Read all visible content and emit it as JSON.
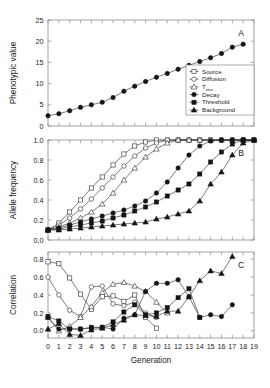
{
  "figure": {
    "xlabel": "Generation",
    "panels": [
      "A",
      "B",
      "C"
    ]
  },
  "legend": {
    "entries": [
      {
        "label": "Source",
        "marker": "open-square"
      },
      {
        "label": "Diffusion",
        "marker": "open-circle"
      },
      {
        "label": "T",
        "sub": "enz",
        "marker": "open-triangle"
      },
      {
        "label": "Decay",
        "marker": "filled-circle"
      },
      {
        "label": "Threshold",
        "marker": "filled-square"
      },
      {
        "label": "Background",
        "marker": "filled-triangle"
      }
    ]
  },
  "chart_data": [
    {
      "type": "line",
      "panel": "A",
      "title": "",
      "xlabel": "",
      "ylabel": "Phenotypic value",
      "xlim": [
        0,
        19
      ],
      "ylim": [
        0,
        25
      ],
      "xticks": [
        0,
        1,
        2,
        3,
        4,
        5,
        6,
        7,
        8,
        9,
        10,
        11,
        12,
        13,
        14,
        15,
        16,
        17,
        18,
        19
      ],
      "yticks": [
        0,
        5,
        10,
        15,
        20,
        25
      ],
      "ytick_labels": [
        "0",
        "5",
        "10",
        "15",
        "20",
        "25"
      ],
      "grid": false,
      "legend_position": "inside-lower-right",
      "series": [
        {
          "name": "Phenotypic value",
          "marker": "filled-circle",
          "x": [
            0,
            1,
            2,
            3,
            4,
            5,
            6,
            7,
            8,
            9,
            10,
            11,
            12,
            13,
            14,
            15,
            16,
            17,
            18
          ],
          "values": [
            2.4,
            2.9,
            3.6,
            4.4,
            5.0,
            5.6,
            6.7,
            8.2,
            9.4,
            10.5,
            11.5,
            12.4,
            13.4,
            14.3,
            15.2,
            16.1,
            17.1,
            18.6,
            19.3,
            21.0
          ]
        }
      ]
    },
    {
      "type": "line",
      "panel": "B",
      "title": "",
      "xlabel": "",
      "ylabel": "Allele frequency",
      "xlim": [
        0,
        19
      ],
      "ylim": [
        0,
        1.0
      ],
      "xticks": [
        0,
        1,
        2,
        3,
        4,
        5,
        6,
        7,
        8,
        9,
        10,
        11,
        12,
        13,
        14,
        15,
        16,
        17,
        18,
        19
      ],
      "yticks": [
        0.0,
        0.2,
        0.4,
        0.6,
        0.8,
        1.0
      ],
      "ytick_labels": [
        "0.0",
        "0.2",
        "0.4",
        "0.6",
        "0.8",
        "1.0"
      ],
      "grid": false,
      "series": [
        {
          "name": "Source",
          "marker": "open-square",
          "x": [
            0,
            1,
            2,
            3,
            4,
            5,
            6,
            7,
            8,
            9,
            10,
            11,
            12,
            13,
            14,
            15,
            16,
            17,
            18,
            19
          ],
          "values": [
            0.1,
            0.17,
            0.28,
            0.4,
            0.52,
            0.63,
            0.75,
            0.86,
            0.94,
            0.98,
            1.0,
            1.0,
            1.0,
            1.0,
            1.0,
            1.0,
            1.0,
            1.0,
            1.0,
            1.0
          ]
        },
        {
          "name": "Diffusion",
          "marker": "open-circle",
          "x": [
            0,
            1,
            2,
            3,
            4,
            5,
            6,
            7,
            8,
            9,
            10,
            11,
            12,
            13,
            14,
            15,
            16,
            17,
            18,
            19
          ],
          "values": [
            0.1,
            0.15,
            0.22,
            0.31,
            0.41,
            0.52,
            0.63,
            0.74,
            0.84,
            0.92,
            0.97,
            1.0,
            1.0,
            1.0,
            1.0,
            1.0,
            1.0,
            1.0,
            1.0,
            1.0
          ]
        },
        {
          "name": "Tenz",
          "marker": "open-triangle",
          "x": [
            0,
            1,
            2,
            3,
            4,
            5,
            6,
            7,
            8,
            9,
            10,
            11,
            12,
            13,
            14,
            15,
            16,
            17,
            18,
            19
          ],
          "values": [
            0.1,
            0.13,
            0.17,
            0.22,
            0.28,
            0.36,
            0.47,
            0.6,
            0.72,
            0.83,
            0.91,
            0.97,
            1.0,
            1.0,
            1.0,
            1.0,
            1.0,
            1.0,
            1.0,
            1.0
          ]
        },
        {
          "name": "Decay",
          "marker": "filled-circle",
          "x": [
            0,
            1,
            2,
            3,
            4,
            5,
            6,
            7,
            8,
            9,
            10,
            11,
            12,
            13,
            14,
            15,
            16,
            17,
            18,
            19
          ],
          "values": [
            0.1,
            0.12,
            0.15,
            0.18,
            0.21,
            0.24,
            0.27,
            0.3,
            0.34,
            0.39,
            0.47,
            0.58,
            0.72,
            0.85,
            0.94,
            0.99,
            1.0,
            1.0,
            1.0,
            1.0
          ]
        },
        {
          "name": "Threshold",
          "marker": "filled-square",
          "x": [
            0,
            1,
            2,
            3,
            4,
            5,
            6,
            7,
            8,
            9,
            10,
            11,
            12,
            13,
            14,
            15,
            16,
            17,
            18,
            19
          ],
          "values": [
            0.1,
            0.11,
            0.13,
            0.15,
            0.17,
            0.19,
            0.22,
            0.25,
            0.29,
            0.33,
            0.38,
            0.44,
            0.5,
            0.56,
            0.66,
            0.78,
            0.88,
            0.96,
            1.0,
            1.0
          ]
        },
        {
          "name": "Background",
          "marker": "filled-triangle",
          "x": [
            0,
            1,
            2,
            3,
            4,
            5,
            6,
            7,
            8,
            9,
            10,
            11,
            12,
            13,
            14,
            15,
            16,
            17,
            18,
            19
          ],
          "values": [
            0.1,
            0.1,
            0.11,
            0.12,
            0.13,
            0.14,
            0.15,
            0.16,
            0.17,
            0.18,
            0.21,
            0.23,
            0.26,
            0.29,
            0.39,
            0.56,
            0.68,
            0.85,
            0.97,
            1.0
          ]
        }
      ]
    },
    {
      "type": "line",
      "panel": "C",
      "title": "",
      "xlabel": "Generation",
      "ylabel": "Correlation",
      "xlim": [
        0,
        19
      ],
      "ylim": [
        -0.08,
        0.88
      ],
      "xticks": [
        0,
        1,
        2,
        3,
        4,
        5,
        6,
        7,
        8,
        9,
        10,
        11,
        12,
        13,
        14,
        15,
        16,
        17,
        18,
        19
      ],
      "yticks": [
        0.0,
        0.2,
        0.4,
        0.6,
        0.8
      ],
      "ytick_labels": [
        "0.0",
        "0.2",
        "0.4",
        "0.6",
        "0.8"
      ],
      "grid": false,
      "series": [
        {
          "name": "Source",
          "marker": "open-square",
          "x": [
            0,
            1,
            2,
            3,
            4,
            5,
            6,
            7,
            8,
            9,
            10
          ],
          "values": [
            0.77,
            0.75,
            0.59,
            0.41,
            0.24,
            0.38,
            0.39,
            0.33,
            0.4,
            0.15,
            0.03
          ]
        },
        {
          "name": "Diffusion",
          "marker": "open-circle",
          "x": [
            0,
            1,
            2,
            3,
            4,
            5,
            6,
            7,
            8,
            9,
            10
          ],
          "values": [
            0.6,
            0.4,
            0.23,
            0.16,
            0.49,
            0.5,
            0.3,
            0.28,
            0.32,
            0.2,
            0.15
          ]
        },
        {
          "name": "Tenz",
          "marker": "open-triangle",
          "x": [
            0,
            1,
            2,
            3,
            4,
            5,
            6,
            7,
            8,
            9,
            10,
            11
          ],
          "values": [
            0.15,
            0.0,
            0.05,
            0.15,
            0.27,
            0.43,
            0.52,
            0.54,
            0.5,
            0.44,
            0.32,
            0.2
          ]
        },
        {
          "name": "Decay",
          "marker": "filled-circle",
          "x": [
            0,
            1,
            2,
            3,
            4,
            5,
            6,
            7,
            8,
            9,
            10,
            11,
            12,
            13,
            14,
            15,
            16,
            17
          ],
          "values": [
            0.15,
            0.02,
            0.02,
            0.02,
            0.03,
            0.04,
            0.02,
            0.14,
            0.18,
            0.44,
            0.53,
            0.53,
            0.57,
            0.38,
            0.15,
            0.18,
            0.16,
            0.29
          ]
        },
        {
          "name": "Threshold",
          "marker": "filled-square",
          "x": [
            0,
            1,
            2,
            3,
            4,
            5,
            6,
            7,
            8,
            9,
            10,
            11,
            12,
            13,
            14
          ],
          "values": [
            0.16,
            0.11,
            0.02,
            0.02,
            0.04,
            0.04,
            0.1,
            0.21,
            0.29,
            0.18,
            0.2,
            0.26,
            0.37,
            0.47,
            0.15
          ]
        },
        {
          "name": "Background",
          "marker": "filled-triangle",
          "x": [
            0,
            1,
            2,
            3,
            4,
            5,
            6,
            7,
            8,
            9,
            10,
            11,
            12,
            13,
            14,
            15,
            16,
            17
          ],
          "values": [
            0.02,
            0.08,
            -0.04,
            -0.05,
            0.01,
            0.03,
            0.07,
            0.12,
            0.18,
            0.17,
            0.16,
            0.22,
            0.22,
            0.38,
            0.56,
            0.67,
            0.64,
            0.83
          ]
        }
      ]
    }
  ]
}
